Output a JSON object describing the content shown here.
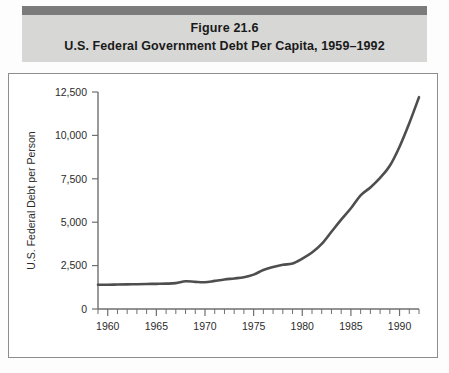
{
  "figure": {
    "number": "Figure 21.6",
    "title": "U.S. Federal Government Debt Per Capita, 1959–1992"
  },
  "colors": {
    "caption_bar": "#7b7b7b",
    "caption_panel": "#d7d7d5",
    "frame_border": "#8d8d8d",
    "axis": "#6f6f6f",
    "line": "#4e4e4e",
    "text": "#1a1a1a"
  },
  "chart_data": {
    "type": "line",
    "title": "U.S. Federal Government Debt Per Capita, 1959–1992",
    "xlabel": "",
    "ylabel": "U.S. Federal Debt per Person",
    "xlim": [
      1959,
      1992
    ],
    "ylim": [
      0,
      12500
    ],
    "grid": false,
    "legend": "none",
    "y_ticks": [
      0,
      2500,
      5000,
      7500,
      10000,
      12500
    ],
    "y_tick_labels": [
      "0",
      "2,500",
      "5,000",
      "7,500",
      "10,000",
      "12,500"
    ],
    "x_ticks": [
      1959,
      1960,
      1961,
      1962,
      1963,
      1964,
      1965,
      1966,
      1967,
      1968,
      1969,
      1970,
      1971,
      1972,
      1973,
      1974,
      1975,
      1976,
      1977,
      1978,
      1979,
      1980,
      1981,
      1982,
      1983,
      1984,
      1985,
      1986,
      1987,
      1988,
      1989,
      1990,
      1991,
      1992
    ],
    "x_tick_labels": [
      {
        "year": 1960,
        "label": "1960"
      },
      {
        "year": 1965,
        "label": "1965"
      },
      {
        "year": 1970,
        "label": "1970"
      },
      {
        "year": 1975,
        "label": "1975"
      },
      {
        "year": 1980,
        "label": "1980"
      },
      {
        "year": 1985,
        "label": "1985"
      },
      {
        "year": 1990,
        "label": "1990"
      }
    ],
    "x": [
      1959,
      1960,
      1961,
      1962,
      1963,
      1964,
      1965,
      1966,
      1967,
      1968,
      1969,
      1970,
      1971,
      1972,
      1973,
      1974,
      1975,
      1976,
      1977,
      1978,
      1979,
      1980,
      1981,
      1982,
      1983,
      1984,
      1985,
      1986,
      1987,
      1988,
      1989,
      1990,
      1991,
      1992
    ],
    "series": [
      {
        "name": "U.S. Federal Debt per Person",
        "values": [
          1400,
          1400,
          1410,
          1420,
          1430,
          1440,
          1450,
          1460,
          1490,
          1600,
          1560,
          1540,
          1620,
          1700,
          1760,
          1830,
          1980,
          2250,
          2420,
          2550,
          2620,
          2900,
          3250,
          3750,
          4450,
          5150,
          5800,
          6550,
          7000,
          7550,
          8250,
          9350,
          10700,
          12200
        ]
      }
    ]
  }
}
